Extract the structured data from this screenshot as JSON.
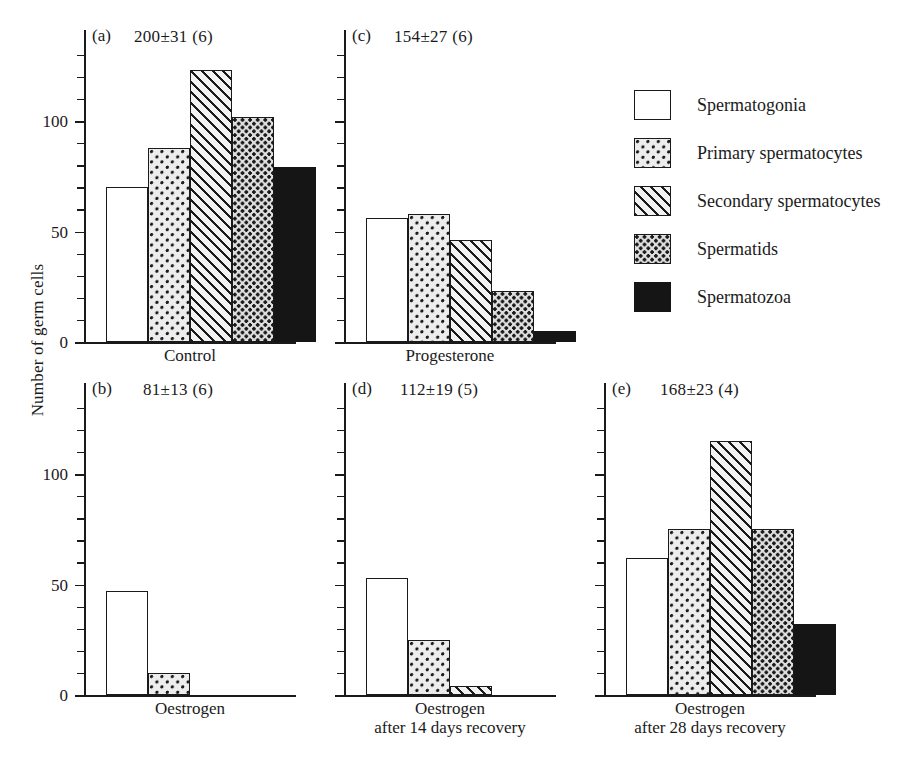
{
  "chart_data": {
    "type": "bar",
    "title": "",
    "xlabel": "",
    "ylabel": "Number of germ cells",
    "ylim": [
      0,
      130
    ],
    "ytick_step": 10,
    "ytick_labels": [
      "0",
      "50",
      "100"
    ],
    "ytick_label_values": [
      0,
      50,
      100
    ],
    "grid": false,
    "legend_position": "right",
    "categories": [
      "Spermatogonia",
      "Primary spermatocytes",
      "Secondary spermatocytes",
      "Spermatids",
      "Spermatozoa"
    ],
    "panels": [
      {
        "tag": "(a)",
        "stat": "200±31 (6)",
        "caption_line1": "Control",
        "caption_line2": "",
        "values": [
          70,
          88,
          123,
          102,
          79
        ]
      },
      {
        "tag": "(b)",
        "stat": "81±13 (6)",
        "caption_line1": "Oestrogen",
        "caption_line2": "",
        "values": [
          47,
          10
        ]
      },
      {
        "tag": "(c)",
        "stat": "154±27 (6)",
        "caption_line1": "Progesterone",
        "caption_line2": "",
        "values": [
          56,
          58,
          46,
          23,
          5
        ]
      },
      {
        "tag": "(d)",
        "stat": "112±19 (5)",
        "caption_line1": "Oestrogen",
        "caption_line2": "after 14 days recovery",
        "values": [
          53,
          25,
          4
        ]
      },
      {
        "tag": "(e)",
        "stat": "168±23 (4)",
        "caption_line1": "Oestrogen",
        "caption_line2": "after 28 days recovery",
        "values": [
          62,
          75,
          115,
          75,
          32
        ]
      }
    ]
  },
  "legend": {
    "items": [
      {
        "label": "Spermatogonia",
        "pattern": "open"
      },
      {
        "label": "Primary spermatocytes",
        "pattern": "dot"
      },
      {
        "label": "Secondary spermatocytes",
        "pattern": "diag"
      },
      {
        "label": "Spermatids",
        "pattern": "check"
      },
      {
        "label": "Spermatozoa",
        "pattern": "solid"
      }
    ]
  },
  "colors": {
    "ink": "#1a1a1a",
    "background": "#ffffff",
    "solid_fill": "#151515"
  }
}
